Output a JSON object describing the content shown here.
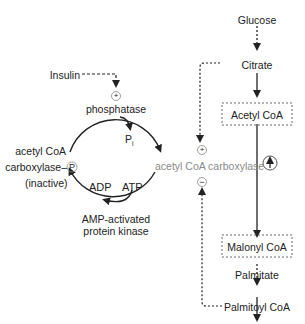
{
  "diagram": {
    "left_cycle": {
      "insulin": "Insulin",
      "activator_sign": "+",
      "phosphatase": "phosphatase",
      "pi": "P",
      "pi_sub": "i",
      "inactive_line1": "acetyl CoA",
      "inactive_line2": "carboxylase–",
      "phospho_tag": "P",
      "inactive_line3": "(inactive)",
      "adp": "ADP",
      "atp": "ATP",
      "kinase_line1": "AMP-activated",
      "kinase_line2": "protein kinase",
      "active_enzyme": "acetyl CoA carboxylase"
    },
    "right_pathway": {
      "glucose": "Glucose",
      "citrate": "Citrate",
      "acetyl_coa": "Acetyl CoA",
      "malonyl_coa": "Malonyl CoA",
      "palmitate": "Palmitate",
      "palmitoyl_coa": "Palmitoyl CoA",
      "citrate_effect": "+",
      "palmitoyl_effect": "−",
      "enzyme_up_arrow": "↑"
    },
    "colors": {
      "line": "#222222",
      "inactive_text": "#8a8a8a"
    }
  }
}
